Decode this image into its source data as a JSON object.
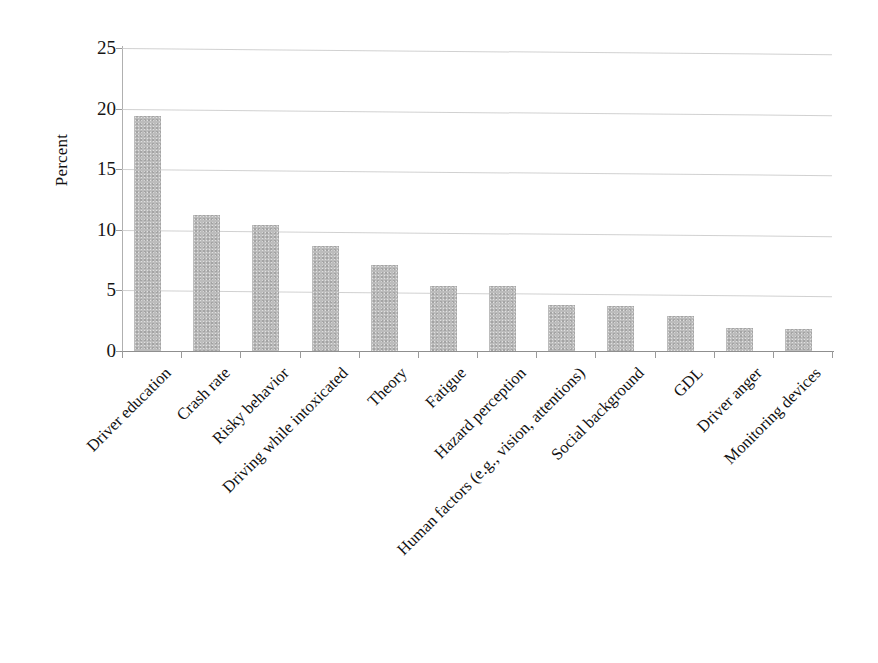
{
  "chart_data": {
    "type": "bar",
    "title": "",
    "subtitle": "",
    "xlabel": "",
    "ylabel": "Percent",
    "ylim": [
      0,
      25
    ],
    "yticks": [
      0,
      5,
      10,
      15,
      20,
      25
    ],
    "ytick_labels": [
      "0",
      "5",
      "10",
      "15",
      "20",
      "25"
    ],
    "grid": true,
    "grid_axis": "y",
    "legend": false,
    "legend_position": "none",
    "bar_color": "#bcbcbc",
    "categories": [
      "Driver education",
      "Crash rate",
      "Risky behavior",
      "Driving while intoxicated",
      "Theory",
      "Fatigue",
      "Hazard perception",
      "Human factors (e.g., vision, attentions)",
      "Social background",
      "GDL",
      "Driver anger",
      "Monitoring devices"
    ],
    "values": [
      19.4,
      11.2,
      10.4,
      8.7,
      7.1,
      5.4,
      5.35,
      3.8,
      3.7,
      2.85,
      1.9,
      1.85
    ]
  },
  "axes": {
    "y_title": "Percent"
  }
}
